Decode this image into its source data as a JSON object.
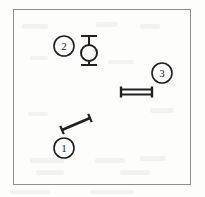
{
  "figure": {
    "background_color": "#fdfdfc",
    "frame": {
      "name": "figure-border",
      "stroke_color": "#8f8f8f",
      "stroke_width": 1.5,
      "x": 13,
      "y": 9,
      "width": 178,
      "height": 176
    },
    "ink_color": "#231f20",
    "callouts": [
      {
        "id": "1",
        "label": "1",
        "cx": 64,
        "cy": 148,
        "r": 10
      },
      {
        "id": "2",
        "label": "2",
        "cx": 64,
        "cy": 46,
        "r": 10
      },
      {
        "id": "3",
        "label": "3",
        "cx": 162,
        "cy": 73,
        "r": 10
      }
    ],
    "objects": [
      {
        "name": "diagonal-dumbbell",
        "callout": "1",
        "description": "diagonal bar with perpendicular end caps",
        "x1": 62,
        "y1": 130,
        "x2": 90,
        "y2": 118,
        "cap_length": 9
      },
      {
        "name": "vertical-ring-dumbbell",
        "callout": "2",
        "description": "circle with vertical stem and horizontal end bars",
        "circle_cx": 89,
        "circle_cy": 53,
        "circle_r": 8,
        "top_bar_y": 36,
        "bottom_bar_y": 65,
        "bar_half_width": 8
      },
      {
        "name": "horizontal-dumbbell",
        "callout": "3",
        "description": "horizontal double bar with vertical end caps",
        "x1": 121,
        "y1": 92,
        "x2": 152,
        "y2": 92,
        "bar_gap": 5,
        "cap_height": 11
      }
    ],
    "noise_blotches": [
      {
        "x": 22,
        "y": 24,
        "w": 26,
        "h": 5
      },
      {
        "x": 96,
        "y": 22,
        "w": 22,
        "h": 5
      },
      {
        "x": 140,
        "y": 24,
        "w": 20,
        "h": 5
      },
      {
        "x": 30,
        "y": 56,
        "w": 18,
        "h": 4
      },
      {
        "x": 108,
        "y": 60,
        "w": 26,
        "h": 4
      },
      {
        "x": 150,
        "y": 108,
        "w": 24,
        "h": 5
      },
      {
        "x": 28,
        "y": 112,
        "w": 20,
        "h": 4
      },
      {
        "x": 30,
        "y": 158,
        "w": 34,
        "h": 5
      },
      {
        "x": 95,
        "y": 158,
        "w": 30,
        "h": 5
      },
      {
        "x": 140,
        "y": 156,
        "w": 26,
        "h": 5
      },
      {
        "x": 36,
        "y": 170,
        "w": 28,
        "h": 5
      },
      {
        "x": 120,
        "y": 170,
        "w": 30,
        "h": 5
      },
      {
        "x": 10,
        "y": 190,
        "w": 40,
        "h": 4
      },
      {
        "x": 90,
        "y": 190,
        "w": 44,
        "h": 4
      }
    ]
  }
}
